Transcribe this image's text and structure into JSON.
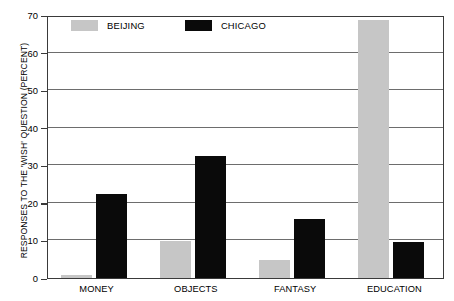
{
  "chart_data": {
    "type": "bar",
    "title": "",
    "xlabel": "",
    "ylabel": "RESPONSES TO THE 'WISH' QUESTION (PERCENT)",
    "ylim": [
      0,
      70
    ],
    "yticks": [
      0,
      10,
      20,
      30,
      40,
      50,
      60,
      70
    ],
    "ytick_labels": [
      "0",
      "10",
      "20",
      "30",
      "40",
      "50",
      "60",
      "70"
    ],
    "grid": true,
    "legend_position": "top-left-inside",
    "categories": [
      "MONEY",
      "OBJECTS",
      "FANTASY",
      "EDUCATION"
    ],
    "series": [
      {
        "name": "BEIJING",
        "color": "#c6c6c6",
        "values": [
          0.8,
          9.8,
          4.8,
          68.7
        ]
      },
      {
        "name": "CHICAGO",
        "color": "#0a0a0a",
        "values": [
          22.4,
          32.6,
          15.6,
          9.5
        ]
      }
    ]
  },
  "legend": {
    "entries": [
      {
        "label": "BEIJING",
        "swatch": "beijing-swatch"
      },
      {
        "label": "CHICAGO",
        "swatch": "chicago-swatch"
      }
    ]
  },
  "axis": {
    "y_title": "RESPONSES TO THE 'WISH' QUESTION (PERCENT)"
  }
}
